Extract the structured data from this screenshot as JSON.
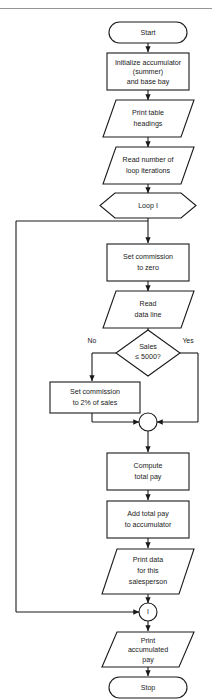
{
  "diagram": {
    "type": "flowchart",
    "colors": {
      "background": "#ffffff",
      "stroke": "#1a1a1a",
      "shape_fill": "#ffffff",
      "rule": "#8a8a8a"
    },
    "top_rule": true,
    "nodes": [
      {
        "id": "start",
        "shape": "terminator",
        "lines": [
          "Start"
        ]
      },
      {
        "id": "initialize",
        "shape": "process",
        "lines": [
          "Initialize accumulator",
          "(summer)",
          "and base bay"
        ]
      },
      {
        "id": "print-headings",
        "shape": "io",
        "lines": [
          "Print table",
          "headings"
        ]
      },
      {
        "id": "read-iterations",
        "shape": "io",
        "lines": [
          "Read number of",
          "loop iterations"
        ]
      },
      {
        "id": "loop-i",
        "shape": "preparation",
        "lines": [
          "Loop I"
        ]
      },
      {
        "id": "set-commission-zero",
        "shape": "process",
        "lines": [
          "Set commission",
          "to zero"
        ]
      },
      {
        "id": "read-data-line",
        "shape": "io",
        "lines": [
          "Read",
          "data line"
        ]
      },
      {
        "id": "sales-decision",
        "shape": "decision",
        "lines": [
          "Sales",
          "≤ 5000?"
        ]
      },
      {
        "id": "set-commission-2pct",
        "shape": "process",
        "lines": [
          "Set commission",
          "to 2% of sales"
        ]
      },
      {
        "id": "merge-junction",
        "shape": "circle",
        "lines": [
          ""
        ]
      },
      {
        "id": "compute-total-pay",
        "shape": "process",
        "lines": [
          "Compute",
          "total pay"
        ]
      },
      {
        "id": "add-total-pay",
        "shape": "process",
        "lines": [
          "Add total pay",
          "to accumulator"
        ]
      },
      {
        "id": "print-data",
        "shape": "io",
        "lines": [
          "Print data",
          "for this",
          "salesperson"
        ]
      },
      {
        "id": "loop-connector",
        "shape": "connector",
        "lines": [
          "I"
        ]
      },
      {
        "id": "print-accumulated",
        "shape": "io",
        "lines": [
          "Print",
          "accumulated",
          "pay"
        ]
      },
      {
        "id": "stop",
        "shape": "terminator",
        "lines": [
          "Stop"
        ]
      }
    ],
    "branch_labels": {
      "no": "No",
      "yes": "Yes"
    }
  }
}
